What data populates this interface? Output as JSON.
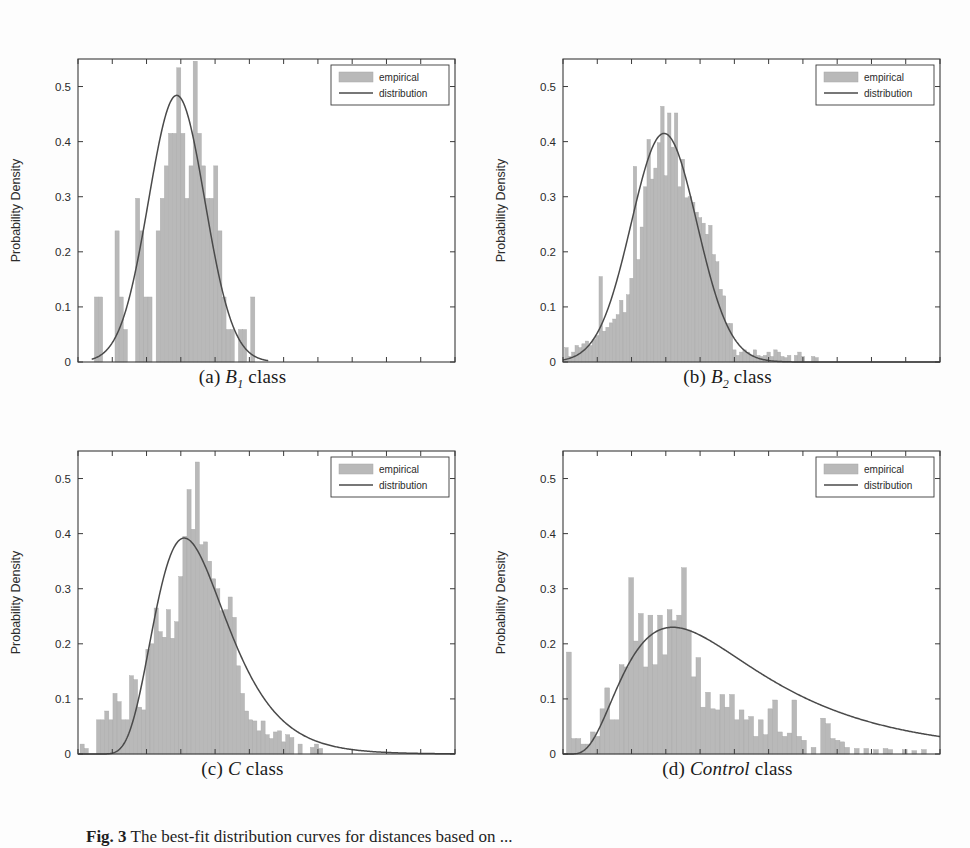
{
  "figure": {
    "caption_prefix": "Fig. 3",
    "caption_text": "The best-fit distribution curves for distances based on ..."
  },
  "legend": {
    "empirical_label": "empirical",
    "distribution_label": "distribution"
  },
  "axis": {
    "xlabel": "Distance",
    "ylabel": "Probability Density",
    "xticks": [
      "0",
      "1",
      "2",
      "3",
      "4",
      "5",
      "6",
      "7",
      "8",
      "9",
      "10",
      "11"
    ],
    "yticks": [
      "0",
      "0.1",
      "0.2",
      "0.3",
      "0.4",
      "0.5"
    ]
  },
  "colors": {
    "bar_fill": "#b9b9b9",
    "bar_edge": "#a8a8a8",
    "curve": "#4a4a4a",
    "axis": "#3a3a3a",
    "background": "#ffffff"
  },
  "subplots": [
    {
      "key": "a",
      "caption_index": "(a)",
      "caption_symbol": "B",
      "caption_subscript": "1",
      "caption_suffix": " class",
      "caption_plain": "(a) B1 class"
    },
    {
      "key": "b",
      "caption_index": "(b)",
      "caption_symbol": "B",
      "caption_subscript": "2",
      "caption_suffix": " class",
      "caption_plain": "(b) B2 class"
    },
    {
      "key": "c",
      "caption_index": "(c)",
      "caption_symbol": "C",
      "caption_subscript": "",
      "caption_suffix": " class",
      "caption_plain": "(c) C class"
    },
    {
      "key": "d",
      "caption_index": "(d)",
      "caption_symbol": "Control",
      "caption_subscript": "",
      "caption_suffix": " class",
      "caption_plain": "(d) Control class"
    }
  ],
  "chart_data": [
    {
      "id": "a",
      "type": "bar",
      "title": "(a) B1 class",
      "xlabel": "Distance",
      "ylabel": "Probability Density",
      "xlim": [
        0,
        11
      ],
      "ylim": [
        0,
        0.55
      ],
      "grid": false,
      "legend_position": "top-right",
      "legend": [
        "empirical",
        "distribution"
      ],
      "bin_width": 0.12,
      "histogram": {
        "bin_left_edges": [
          0.48,
          0.6,
          1.08,
          1.2,
          1.32,
          1.68,
          1.8,
          1.92,
          2.04,
          2.28,
          2.4,
          2.52,
          2.64,
          2.76,
          2.88,
          3.0,
          3.12,
          3.24,
          3.36,
          3.48,
          3.6,
          3.72,
          3.84,
          3.96,
          4.08,
          4.2,
          4.32,
          4.44,
          4.68,
          4.8,
          5.04
        ],
        "values": [
          0.118,
          0.118,
          0.238,
          0.118,
          0.059,
          0.297,
          0.238,
          0.118,
          0.118,
          0.238,
          0.297,
          0.356,
          0.415,
          0.415,
          0.534,
          0.415,
          0.297,
          0.356,
          0.546,
          0.415,
          0.356,
          0.297,
          0.297,
          0.356,
          0.238,
          0.118,
          0.059,
          0.059,
          0.059,
          0.059,
          0.118
        ]
      },
      "curve": {
        "kind": "gaussian-like",
        "peak_x": 2.88,
        "peak_y": 0.484,
        "sigma": 0.82,
        "x_start": 0.4,
        "x_end": 5.55
      }
    },
    {
      "id": "b",
      "type": "bar",
      "title": "(b) B2 class",
      "xlabel": "Distance",
      "ylabel": "Probability Density",
      "xlim": [
        0,
        11
      ],
      "ylim": [
        0,
        0.55
      ],
      "grid": false,
      "legend_position": "top-right",
      "legend": [
        "empirical",
        "distribution"
      ],
      "bin_width": 0.1,
      "histogram": {
        "bin_left_edges": [
          0.05,
          0.15,
          0.25,
          0.35,
          0.45,
          0.55,
          0.65,
          0.75,
          0.85,
          0.95,
          1.05,
          1.15,
          1.25,
          1.35,
          1.45,
          1.55,
          1.65,
          1.75,
          1.85,
          1.95,
          2.05,
          2.15,
          2.25,
          2.35,
          2.45,
          2.55,
          2.65,
          2.75,
          2.85,
          2.95,
          3.05,
          3.15,
          3.25,
          3.35,
          3.45,
          3.55,
          3.65,
          3.75,
          3.85,
          3.95,
          4.05,
          4.15,
          4.25,
          4.35,
          4.45,
          4.55,
          4.65,
          4.75,
          4.85,
          4.95,
          5.05,
          5.15,
          5.25,
          5.35,
          5.45,
          5.55,
          5.65,
          5.75,
          5.85,
          5.95,
          6.05,
          6.15,
          6.25,
          6.35,
          6.45,
          6.55,
          6.75,
          6.85,
          6.95,
          7.25,
          7.35
        ],
        "values": [
          0.026,
          0.01,
          0.018,
          0.03,
          0.026,
          0.033,
          0.038,
          0.03,
          0.041,
          0.048,
          0.155,
          0.056,
          0.063,
          0.071,
          0.078,
          0.086,
          0.112,
          0.09,
          0.122,
          0.152,
          0.355,
          0.186,
          0.245,
          0.318,
          0.404,
          0.332,
          0.352,
          0.398,
          0.464,
          0.338,
          0.452,
          0.39,
          0.452,
          0.318,
          0.368,
          0.298,
          0.3,
          0.29,
          0.272,
          0.262,
          0.252,
          0.232,
          0.248,
          0.195,
          0.182,
          0.132,
          0.12,
          0.07,
          0.07,
          0.022,
          0.012,
          0.018,
          0.022,
          0.018,
          0.012,
          0.022,
          0.012,
          0.01,
          0.012,
          0.018,
          0.01,
          0.022,
          0.018,
          0.01,
          0.008,
          0.012,
          0.012,
          0.018,
          0.01,
          0.01,
          0.008
        ]
      },
      "curve": {
        "kind": "gaussian-like",
        "peak_x": 2.95,
        "peak_y": 0.415,
        "sigma": 0.96,
        "x_start": 0.0,
        "x_end": 11.0
      }
    },
    {
      "id": "c",
      "type": "bar",
      "title": "(c) C class",
      "xlabel": "Distance",
      "ylabel": "Probability Density",
      "xlim": [
        0,
        11
      ],
      "ylim": [
        0,
        0.55
      ],
      "grid": false,
      "legend_position": "top-right",
      "legend": [
        "empirical",
        "distribution"
      ],
      "bin_width": 0.12,
      "histogram": {
        "bin_left_edges": [
          0.06,
          0.18,
          0.54,
          0.66,
          0.78,
          0.9,
          1.02,
          1.14,
          1.26,
          1.38,
          1.5,
          1.62,
          1.74,
          1.86,
          1.98,
          2.1,
          2.22,
          2.34,
          2.46,
          2.58,
          2.7,
          2.82,
          2.94,
          3.06,
          3.18,
          3.3,
          3.42,
          3.54,
          3.66,
          3.78,
          3.9,
          4.02,
          4.14,
          4.26,
          4.38,
          4.5,
          4.62,
          4.74,
          4.86,
          4.98,
          5.1,
          5.22,
          5.34,
          5.46,
          5.58,
          5.7,
          5.82,
          5.94,
          6.06,
          6.18,
          6.42,
          6.78,
          6.9,
          7.02
        ],
        "values": [
          0.018,
          0.01,
          0.062,
          0.062,
          0.078,
          0.062,
          0.11,
          0.095,
          0.062,
          0.062,
          0.142,
          0.135,
          0.085,
          0.08,
          0.19,
          0.2,
          0.265,
          0.222,
          0.212,
          0.262,
          0.21,
          0.24,
          0.322,
          0.395,
          0.48,
          0.408,
          0.53,
          0.38,
          0.385,
          0.35,
          0.318,
          0.3,
          0.26,
          0.262,
          0.285,
          0.248,
          0.16,
          0.11,
          0.078,
          0.062,
          0.06,
          0.042,
          0.06,
          0.035,
          0.028,
          0.04,
          0.042,
          0.022,
          0.035,
          0.03,
          0.018,
          0.012,
          0.018,
          0.01
        ]
      },
      "curve": {
        "kind": "skewed",
        "peak_x": 3.1,
        "peak_y": 0.392,
        "sigma": 1.02,
        "x_start": 0.0,
        "x_end": 11.0
      }
    },
    {
      "id": "d",
      "type": "bar",
      "title": "(d) Control class",
      "xlabel": "Distance",
      "ylabel": "Probability Density",
      "xlim": [
        0,
        11
      ],
      "ylim": [
        0,
        0.55
      ],
      "grid": false,
      "legend_position": "top-right",
      "legend": [
        "empirical",
        "distribution"
      ],
      "bin_width": 0.14,
      "histogram": {
        "bin_left_edges": [
          0.1,
          0.24,
          0.38,
          0.52,
          0.66,
          0.8,
          0.94,
          1.08,
          1.22,
          1.36,
          1.5,
          1.64,
          1.78,
          1.92,
          2.06,
          2.2,
          2.34,
          2.48,
          2.62,
          2.76,
          2.9,
          3.04,
          3.18,
          3.32,
          3.46,
          3.6,
          3.74,
          3.88,
          4.02,
          4.16,
          4.3,
          4.44,
          4.58,
          4.72,
          4.86,
          5.0,
          5.14,
          5.28,
          5.42,
          5.56,
          5.7,
          5.84,
          5.98,
          6.12,
          6.26,
          6.4,
          6.54,
          6.68,
          6.82,
          6.96,
          7.24,
          7.52,
          7.66,
          7.8,
          7.94,
          8.08,
          8.22,
          8.5,
          8.78,
          9.06,
          9.34,
          9.48,
          9.9,
          10.18,
          10.46
        ],
        "values": [
          0.185,
          0.028,
          0.028,
          0.018,
          0.018,
          0.04,
          0.032,
          0.082,
          0.12,
          0.062,
          0.062,
          0.162,
          0.158,
          0.32,
          0.205,
          0.255,
          0.158,
          0.252,
          0.162,
          0.252,
          0.18,
          0.262,
          0.242,
          0.252,
          0.338,
          0.225,
          0.14,
          0.175,
          0.085,
          0.112,
          0.082,
          0.08,
          0.108,
          0.085,
          0.108,
          0.062,
          0.08,
          0.062,
          0.068,
          0.032,
          0.062,
          0.035,
          0.082,
          0.098,
          0.04,
          0.032,
          0.038,
          0.098,
          0.032,
          0.025,
          0.012,
          0.065,
          0.055,
          0.028,
          0.025,
          0.022,
          0.012,
          0.01,
          0.01,
          0.008,
          0.01,
          0.008,
          0.008,
          0.006,
          0.008
        ]
      },
      "curve": {
        "kind": "broad-skewed",
        "peak_x": 3.2,
        "peak_y": 0.23,
        "sigma": 2.15,
        "x_start": 0.0,
        "x_end": 11.0
      }
    }
  ]
}
